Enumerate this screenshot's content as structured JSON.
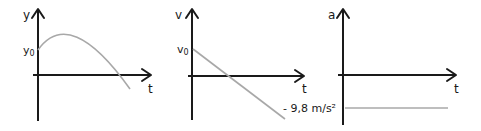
{
  "figure": {
    "panels": [
      {
        "id": "position",
        "y_axis_label": "y",
        "x_axis_label": "t",
        "initial_label_base": "y",
        "initial_label_sub": "0",
        "curve_type": "parabola (concave down)"
      },
      {
        "id": "velocity",
        "y_axis_label": "v",
        "x_axis_label": "t",
        "initial_label_base": "v",
        "initial_label_sub": "0",
        "curve_type": "line (negative slope)",
        "slope_label": "- 9,8 m/s²"
      },
      {
        "id": "acceleration",
        "y_axis_label": "a",
        "x_axis_label": "t",
        "curve_type": "constant (negative)",
        "value_label": "- 9,8 m/s²"
      }
    ]
  },
  "colors": {
    "axis": "#1a1a1a",
    "curve": "#a8a8a8",
    "background": "#ffffff"
  }
}
